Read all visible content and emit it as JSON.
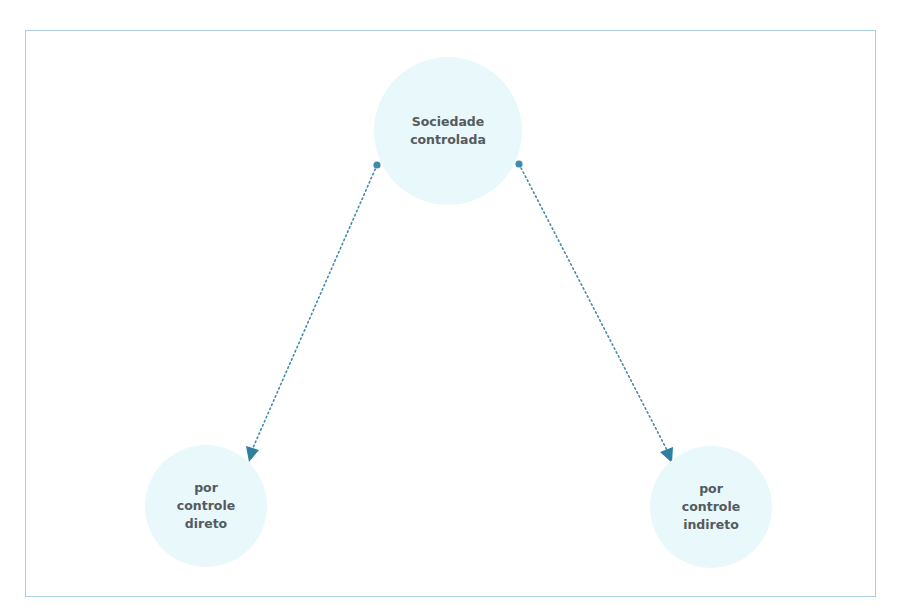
{
  "diagram": {
    "colors": {
      "frame_border": "#a9cfe0",
      "node_fill": "#e8f8fb",
      "connector": "#3f8bab",
      "arrowhead": "#2f7f9f",
      "label_text": "#555a5e"
    },
    "nodes": {
      "root": {
        "label": "Sociedade\ncontrolada"
      },
      "left": {
        "label": "por\ncontrole\ndireto"
      },
      "right": {
        "label": "por\ncontrole\nindireto"
      }
    },
    "edges": [
      {
        "from": "root",
        "to": "left",
        "style": "dotted",
        "start_marker": "dot",
        "end_marker": "arrow"
      },
      {
        "from": "root",
        "to": "right",
        "style": "dotted",
        "start_marker": "dot",
        "end_marker": "arrow"
      }
    ]
  }
}
